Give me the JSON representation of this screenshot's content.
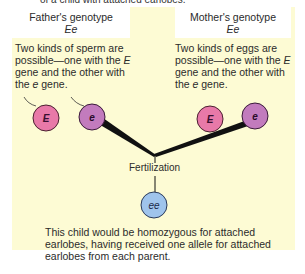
{
  "top_cut_text": "of a child with attached earlobes.",
  "father": {
    "title": "Father's genotype",
    "genotype": "Ee",
    "desc_1": "Two kinds of sperm are possible—one with the ",
    "allele_dominant": "E",
    "desc_2": " gene and the other with the ",
    "allele_recessive": "e",
    "desc_3": " gene.",
    "gametes": [
      {
        "label": "E",
        "color": "#e879a8"
      },
      {
        "label": "e",
        "color": "#c27bbd"
      }
    ]
  },
  "mother": {
    "title": "Mother's genotype",
    "genotype": "Ee",
    "desc_1": "Two kinds of eggs are possible—one with the ",
    "allele_dominant": "E",
    "desc_2": " gene and the other with the ",
    "allele_recessive": "e",
    "desc_3": " gene.",
    "gametes": [
      {
        "label": "E",
        "color": "#e879a8"
      },
      {
        "label": "e",
        "color": "#c27bbd"
      }
    ]
  },
  "fertilization_label": "Fertilization",
  "child": {
    "label": "ee",
    "color": "#9fc4ec"
  },
  "conclusion": "This child would be homozygous for attached earlobes, having received one allele for attached earlobes from each parent.",
  "colors": {
    "panel_bg": "#fdfbd4",
    "box_bg": "#ffffff",
    "line": "#111111"
  }
}
